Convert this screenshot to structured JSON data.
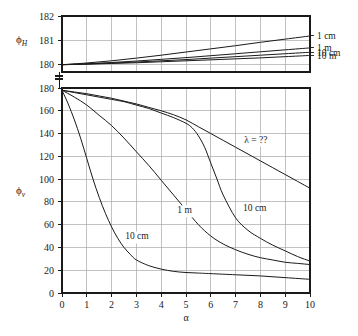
{
  "chart_data": {
    "type": "line",
    "title": "",
    "subtitle": "",
    "xlabel": "α",
    "xlim": [
      0,
      10
    ],
    "xticks": [
      0,
      1,
      2,
      3,
      4,
      5,
      6,
      7,
      8,
      9,
      10
    ],
    "xtick_labels": [
      "0",
      "1",
      "2",
      "3",
      "4",
      "5",
      "6",
      "7",
      "8",
      "9",
      "10"
    ],
    "grid": true,
    "legend_position": "inline-annotations",
    "panels": [
      {
        "name": "upper-panel",
        "ylabel": "ϕ_H",
        "ylabel_base": "ϕ",
        "ylabel_sub": "H",
        "ylim": [
          179.7,
          182
        ],
        "yticks": [
          180,
          181,
          182
        ],
        "ytick_labels": [
          "180",
          "181",
          "182"
        ],
        "axis_break": true,
        "series": [
          {
            "name": "1 cm",
            "label": "1 cm",
            "x": [
              0,
              1,
              2,
              3,
              4,
              5,
              6,
              7,
              8,
              9,
              10
            ],
            "values": [
              180.0,
              180.07,
              180.16,
              180.27,
              180.39,
              180.52,
              180.65,
              180.78,
              180.92,
              181.05,
              181.18
            ]
          },
          {
            "name": "1 m",
            "label": "1 m",
            "x": [
              0,
              1,
              2,
              3,
              4,
              5,
              6,
              7,
              8,
              9,
              10
            ],
            "values": [
              180.0,
              180.04,
              180.09,
              180.15,
              180.22,
              180.29,
              180.37,
              180.45,
              180.53,
              180.61,
              180.69
            ]
          },
          {
            "name": "10 cm",
            "label": "10 cm",
            "x": [
              0,
              1,
              2,
              3,
              4,
              5,
              6,
              7,
              8,
              9,
              10
            ],
            "values": [
              180.0,
              180.03,
              180.07,
              180.11,
              180.16,
              180.21,
              180.27,
              180.33,
              180.39,
              180.45,
              180.51
            ]
          },
          {
            "name": "10 m",
            "label": "10 m",
            "x": [
              0,
              1,
              2,
              3,
              4,
              5,
              6,
              7,
              8,
              9,
              10
            ],
            "values": [
              180.0,
              180.02,
              180.05,
              180.08,
              180.12,
              180.16,
              180.2,
              180.24,
              180.28,
              180.33,
              180.38
            ]
          }
        ]
      },
      {
        "name": "lower-panel",
        "ylabel": "ϕ_v",
        "ylabel_base": "ϕ",
        "ylabel_sub": "v",
        "ylim": [
          0,
          180
        ],
        "yticks": [
          0,
          20,
          40,
          60,
          80,
          100,
          120,
          140,
          160,
          180
        ],
        "ytick_labels": [
          "0",
          "20",
          "40",
          "60",
          "80",
          "100",
          "120",
          "140",
          "160",
          "180"
        ],
        "series": [
          {
            "name": "lambda-unknown",
            "label": "λ = ??",
            "label_x": 7.35,
            "label_y": 132,
            "x": [
              0,
              0.5,
              1,
              1.5,
              2,
              2.5,
              3,
              3.5,
              4,
              4.5,
              5,
              5.5,
              6,
              6.5,
              7,
              7.5,
              8,
              8.5,
              9,
              9.5,
              10
            ],
            "values": [
              178,
              176.5,
              175,
              173,
              171,
              168.5,
              166,
              163,
              160,
              156.5,
              152,
              146,
              140,
              134,
              128,
              122,
              116,
              110,
              104,
              98,
              92
            ]
          },
          {
            "name": "10-cm-upper",
            "label": "10 cm",
            "label_x": 7.3,
            "label_y": 72,
            "x": [
              0,
              0.5,
              1,
              1.5,
              2,
              2.5,
              3,
              3.5,
              4,
              4.5,
              5,
              5.25,
              5.5,
              5.75,
              6,
              6.25,
              6.5,
              7,
              7.5,
              8,
              8.5,
              9,
              9.5,
              10
            ],
            "values": [
              178,
              176,
              174,
              172,
              170,
              168,
              165,
              162,
              158,
              154,
              149,
              145,
              138,
              128,
              114,
              100,
              86,
              66,
              55,
              48,
              42,
              37,
              32,
              28
            ]
          },
          {
            "name": "1-m",
            "label": "1 m",
            "label_x": 4.65,
            "label_y": 70,
            "x": [
              0,
              0.5,
              1,
              1.5,
              2,
              2.5,
              3,
              3.5,
              4,
              4.5,
              5,
              5.5,
              6,
              6.5,
              7,
              7.5,
              8,
              8.5,
              9,
              9.5,
              10
            ],
            "values": [
              178,
              172,
              165,
              156,
              147,
              136,
              124,
              112,
              99,
              86,
              73,
              60,
              50,
              43,
              38,
              34,
              31,
              29,
              27,
              26,
              25
            ]
          },
          {
            "name": "10-cm-lower",
            "label": "10 cm",
            "label_x": 2.55,
            "label_y": 47,
            "x": [
              0,
              0.25,
              0.5,
              0.75,
              1,
              1.25,
              1.5,
              1.75,
              2,
              2.25,
              2.5,
              2.75,
              3,
              3.5,
              4,
              4.5,
              5,
              5.5,
              6,
              7,
              8,
              9,
              10
            ],
            "values": [
              178,
              166,
              152,
              136,
              118,
              100,
              84,
              70,
              58,
              48,
              40,
              34,
              29,
              24,
              21,
              19,
              18,
              17.5,
              17,
              16,
              15,
              13.5,
              12
            ]
          }
        ]
      }
    ],
    "right_labels": [
      {
        "text": "1 cm",
        "y_value": 181.18
      },
      {
        "text": "1 m",
        "y_value": 180.69
      },
      {
        "text": "10 cm",
        "y_value": 180.51
      },
      {
        "text": "10 m",
        "y_value": 180.38
      }
    ],
    "annotations": [
      {
        "text": "λ = ??",
        "panel": "lower",
        "x": 7.35,
        "y": 132
      },
      {
        "text": "10 cm",
        "panel": "lower",
        "x": 7.3,
        "y": 72
      },
      {
        "text": "1 m",
        "panel": "lower",
        "x": 4.65,
        "y": 70
      },
      {
        "text": "10 cm",
        "panel": "lower",
        "x": 2.55,
        "y": 47
      }
    ],
    "colors": {
      "line": "#1a1a1a",
      "grid": "#a8a8a8",
      "axis": "#1a1a1a",
      "background": "#ffffff"
    }
  }
}
